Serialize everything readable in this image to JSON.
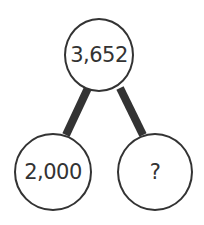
{
  "diagram": {
    "type": "number-bond",
    "whole": "3,652",
    "parts": [
      "2,000",
      "?"
    ],
    "line_color": "#333333",
    "circle_border_color": "#333333"
  }
}
